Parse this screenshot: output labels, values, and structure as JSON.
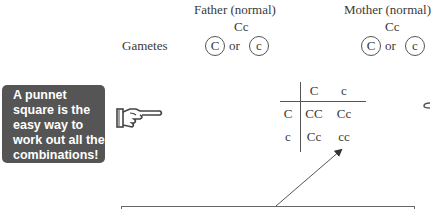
{
  "parents": {
    "father": {
      "label": "Father (normal)",
      "genotype": "Cc",
      "gametes": [
        "C",
        "c"
      ]
    },
    "mother": {
      "label": "Mother (normal)",
      "genotype": "Cc",
      "gametes": [
        "C",
        "c"
      ]
    },
    "or_text": "or"
  },
  "gametes_label": "Gametes",
  "callout": {
    "text": "A punnet square is the easy way to work out all the combinations!",
    "background": "#555555",
    "icon": "pointing-hand-icon"
  },
  "punnett_square": {
    "column_headers": [
      "C",
      "c"
    ],
    "row_headers": [
      "C",
      "c"
    ],
    "cells": [
      [
        "CC",
        "Cc"
      ],
      [
        "Cc",
        "cc"
      ]
    ]
  }
}
